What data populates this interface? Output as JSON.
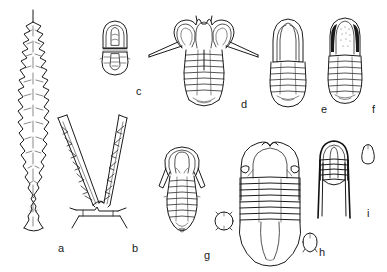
{
  "plate": {
    "kind": "scientific-illustration-plate",
    "subject": "graptolites and trilobites line drawings",
    "background_color": "#ffffff",
    "ink_color": "#1a1a1a",
    "width": 387,
    "height": 272
  },
  "figures": [
    {
      "key": "a",
      "label": "a",
      "label_x": 58,
      "label_y": 243,
      "type": "graptolite",
      "description": "elongate serrated rhabdosome with nema at top"
    },
    {
      "key": "b",
      "label": "b",
      "label_x": 132,
      "label_y": 243,
      "type": "graptolite",
      "description": "tuning-fork biserial rhabdosome with sicula"
    },
    {
      "key": "c",
      "label": "c",
      "label_x": 136,
      "label_y": 86,
      "type": "trilobite",
      "description": "small cephalon and pygidium, two pieces"
    },
    {
      "key": "d",
      "label": "d",
      "label_x": 241,
      "label_y": 99,
      "type": "trilobite",
      "description": "dorsal view with large crescentic eyes and long genal spines"
    },
    {
      "key": "e",
      "label": "e",
      "label_x": 321,
      "label_y": 104,
      "type": "trilobite",
      "description": "elongate dorsal view, smooth glabella"
    },
    {
      "key": "f",
      "label": "f",
      "label_x": 372,
      "label_y": 104,
      "type": "trilobite",
      "description": "elongate dorsal view, granulate glabella, dark genal areas"
    },
    {
      "key": "g",
      "label": "g",
      "label_x": 204,
      "label_y": 250,
      "type": "trilobite",
      "description": "dorsal view with short genal spines, plus small circular detail"
    },
    {
      "key": "h",
      "label": "h",
      "label_x": 319,
      "label_y": 247,
      "type": "trilobite",
      "description": "large dorsal view with broad pygidium, plus small rounded detail"
    },
    {
      "key": "i",
      "label": "i",
      "label_x": 367,
      "label_y": 208,
      "type": "trilobite",
      "description": "cephalon with long genal spines, plus small teardrop detail"
    }
  ]
}
